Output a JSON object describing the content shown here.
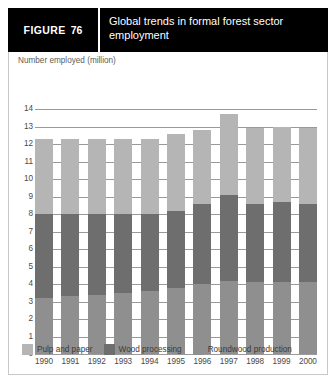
{
  "figure": {
    "label_word": "FIGURE",
    "number": "76",
    "title": "Global trends in formal forest sector employment"
  },
  "colors": {
    "header_bg": "#000000",
    "header_text": "#ffffff",
    "pulp_and_paper": "#b5b5b5",
    "wood_processing": "#6e6e6e",
    "roundwood_production": "#8f8f8f",
    "gridline": "#9a9a9a",
    "axis_text": "#4a4a4a"
  },
  "chart_data": {
    "type": "bar",
    "stacked": true,
    "title": "Global trends in formal forest sector employment",
    "xlabel": "",
    "ylabel": "Number employed (million)",
    "ylim": [
      0,
      14
    ],
    "ytick_step": 1,
    "yticks": [
      "14",
      "13",
      "12",
      "11",
      "10",
      "9",
      "8",
      "7",
      "6",
      "5",
      "4",
      "3",
      "2",
      "1",
      "0"
    ],
    "grid": true,
    "legend_position": "bottom",
    "categories": [
      "1990",
      "1991",
      "1992",
      "1993",
      "1994",
      "1995",
      "1996",
      "1997",
      "1998",
      "1999",
      "2000"
    ],
    "series": [
      {
        "name": "Roundwood production",
        "color": "#8f8f8f",
        "values": [
          3.2,
          3.3,
          3.4,
          3.5,
          3.6,
          3.8,
          4.0,
          4.2,
          4.1,
          4.1,
          4.1
        ]
      },
      {
        "name": "Wood processing",
        "color": "#6e6e6e",
        "values": [
          4.8,
          4.7,
          4.6,
          4.5,
          4.4,
          4.4,
          4.6,
          4.9,
          4.5,
          4.6,
          4.5
        ]
      },
      {
        "name": "Pulp and paper",
        "color": "#b5b5b5",
        "values": [
          4.3,
          4.3,
          4.3,
          4.3,
          4.3,
          4.4,
          4.2,
          4.6,
          4.3,
          4.3,
          4.3
        ]
      }
    ],
    "totals": [
      12.3,
      12.3,
      12.3,
      12.3,
      12.3,
      12.6,
      12.8,
      13.7,
      12.9,
      13.0,
      12.9
    ]
  },
  "legend": {
    "items": [
      {
        "label": "Pulp and paper",
        "color": "#b5b5b5"
      },
      {
        "label": "Wood processing",
        "color": "#6e6e6e"
      },
      {
        "label": "Roundwood production",
        "color": "#8f8f8f"
      }
    ]
  }
}
